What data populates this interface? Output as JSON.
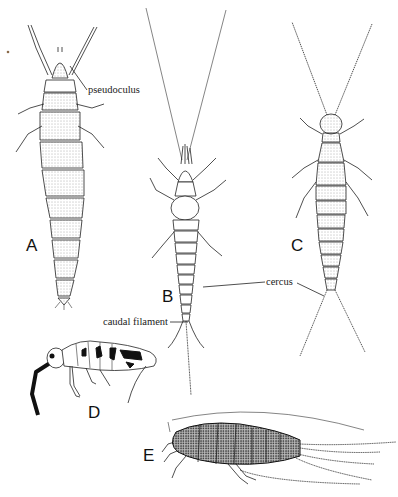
{
  "figure": {
    "panels": [
      {
        "letter": "A",
        "subject": "proturan (dorsal view)"
      },
      {
        "letter": "B",
        "subject": "bristletail / dipluran (dorsal view, long antennae)"
      },
      {
        "letter": "C",
        "subject": "dipluran with cerci (dorsal view)"
      },
      {
        "letter": "D",
        "subject": "springtail (lateral view)"
      },
      {
        "letter": "E",
        "subject": "silverfish (dorsal view)"
      }
    ],
    "annotations": {
      "pseudoculus": "pseudoculus",
      "cercus": "cercus",
      "caudal_filament": "caudal filament"
    },
    "colors": {
      "background": "#ffffff",
      "ink": "#222222"
    }
  }
}
